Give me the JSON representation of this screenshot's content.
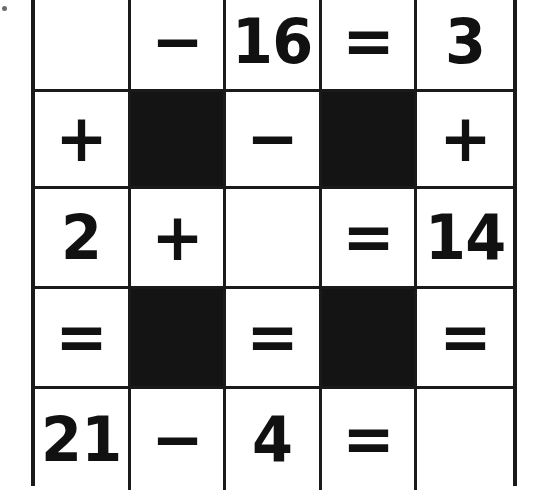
{
  "puzzle": {
    "title": "Arithmetic Cross-Number Puzzle",
    "type": "math-crossword-grid",
    "rows": 5,
    "columns": 5,
    "colors": {
      "grid_line": "#1a1a1a",
      "cell_background": "#ffffff",
      "blocked_cell": "#141414",
      "glyph": "#111111"
    },
    "cells": [
      [
        {
          "value": "",
          "kind": "empty"
        },
        {
          "value": "−",
          "kind": "operator"
        },
        {
          "value": "16",
          "kind": "number"
        },
        {
          "value": "=",
          "kind": "operator"
        },
        {
          "value": "3",
          "kind": "number"
        }
      ],
      [
        {
          "value": "+",
          "kind": "operator"
        },
        {
          "value": "",
          "kind": "blocked"
        },
        {
          "value": "−",
          "kind": "operator"
        },
        {
          "value": "",
          "kind": "blocked"
        },
        {
          "value": "+",
          "kind": "operator"
        }
      ],
      [
        {
          "value": "2",
          "kind": "number"
        },
        {
          "value": "+",
          "kind": "operator"
        },
        {
          "value": "",
          "kind": "empty"
        },
        {
          "value": "=",
          "kind": "operator"
        },
        {
          "value": "14",
          "kind": "number"
        }
      ],
      [
        {
          "value": "=",
          "kind": "operator"
        },
        {
          "value": "",
          "kind": "blocked"
        },
        {
          "value": "=",
          "kind": "operator"
        },
        {
          "value": "",
          "kind": "blocked"
        },
        {
          "value": "=",
          "kind": "operator"
        }
      ],
      [
        {
          "value": "21",
          "kind": "number"
        },
        {
          "value": "−",
          "kind": "operator"
        },
        {
          "value": "4",
          "kind": "number"
        },
        {
          "value": "=",
          "kind": "operator"
        },
        {
          "value": "",
          "kind": "empty"
        }
      ]
    ]
  }
}
